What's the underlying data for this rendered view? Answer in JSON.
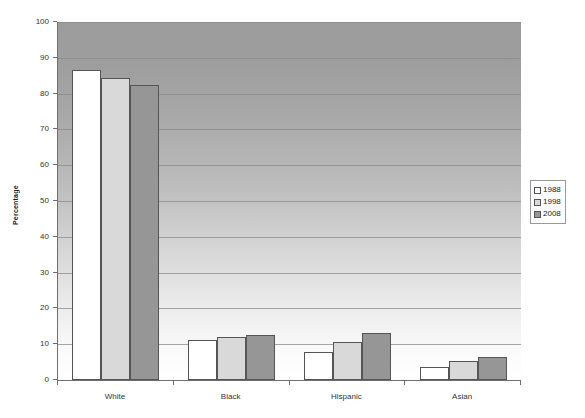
{
  "chart_data": {
    "type": "bar",
    "title": "",
    "subtitle": "",
    "xlabel": "",
    "ylabel": "Percentage",
    "categories": [
      "White",
      "Black",
      "Hispanic",
      "Asian"
    ],
    "series": [
      {
        "name": "1988",
        "color": "#ffffff",
        "values": [
          86.5,
          11.2,
          7.7,
          3.6
        ]
      },
      {
        "name": "1998",
        "color": "#d9d9d9",
        "values": [
          84.3,
          12.0,
          10.5,
          5.2
        ]
      },
      {
        "name": "2008",
        "color": "#969696",
        "values": [
          82.4,
          12.6,
          13.0,
          6.3
        ]
      }
    ],
    "ylim": [
      0,
      100
    ],
    "ytick_labels": [
      "0",
      "10",
      "20",
      "30",
      "40",
      "50",
      "60",
      "70",
      "80",
      "90",
      "100"
    ],
    "ytick_values": [
      0,
      10,
      20,
      30,
      40,
      50,
      60,
      70,
      80,
      90,
      100
    ],
    "grid": true,
    "legend_position": "right",
    "plot_background": "vertical gradient dark gray to white",
    "colors": {
      "grid": "#8a8a8a",
      "axis": "#6e6e6e",
      "bar_border": "#555555",
      "text": "#333333"
    }
  }
}
